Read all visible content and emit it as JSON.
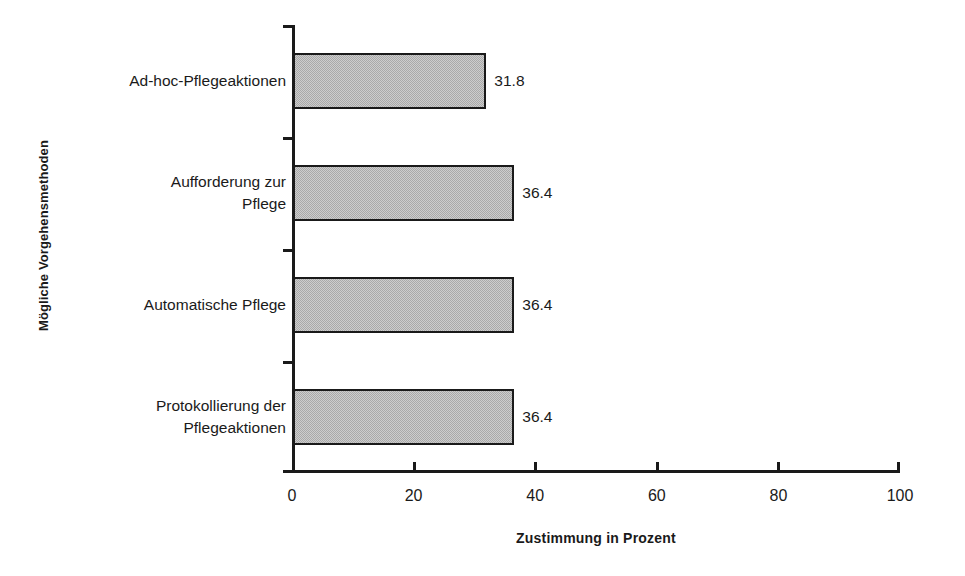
{
  "chart_data": {
    "type": "bar",
    "orientation": "horizontal",
    "title": "",
    "xlabel": "Zustimmung in Prozent",
    "ylabel": "Mögliche Vorgehensmethoden",
    "categories": [
      "Ad-hoc-Pflegeaktionen",
      "Aufforderung zur\nPflege",
      "Automatische Pflege",
      "Protokollierung der\nPflegeaktionen"
    ],
    "values": [
      31.8,
      36.4,
      36.4,
      36.4
    ],
    "value_labels": [
      "31.8",
      "36.4",
      "36.4",
      "36.4"
    ],
    "xlim": [
      0,
      100
    ],
    "xticks": [
      0,
      20,
      40,
      60,
      80,
      100
    ],
    "xtick_labels": [
      "0",
      "20",
      "40",
      "60",
      "80",
      "100"
    ],
    "grid": false,
    "legend": false,
    "bar_color": "#a9a9a9",
    "bar_border_color": "#1a1a1a",
    "axis_color": "#1a1a1a",
    "background": "#ffffff"
  }
}
